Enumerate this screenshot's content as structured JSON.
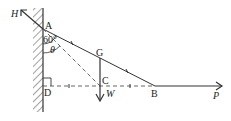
{
  "diagram": {
    "points": {
      "A": "A",
      "G": "G",
      "C": "C",
      "D": "D",
      "B": "B"
    },
    "forces": {
      "H": "H",
      "W": "W",
      "P": "P"
    },
    "angles": {
      "alpha": "60°",
      "theta": "θ"
    },
    "colors": {
      "stroke": "#333333",
      "background": "#ffffff"
    }
  }
}
